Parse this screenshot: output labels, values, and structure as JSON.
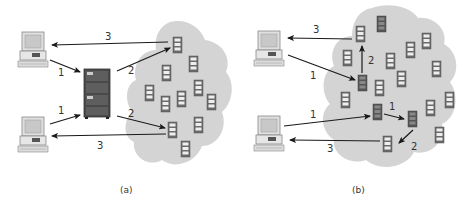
{
  "panels": [
    {
      "caption": "(a)",
      "arrow_labels": {
        "top_in": "1",
        "bottom_in": "1",
        "top_out": "2",
        "bottom_out": "2",
        "top_return": "3",
        "bottom_return": "3"
      }
    },
    {
      "caption": "(b)",
      "arrow_labels": {
        "top_in": "1",
        "top_hop": "2",
        "top_return": "3",
        "bottom_in": "1",
        "bottom_hop1": "1",
        "bottom_hop2": "2",
        "bottom_return": "3"
      }
    }
  ],
  "colors": {
    "cloud": "#d4d4d4",
    "arrow": "#1a1a1a",
    "server_dark": "#555555",
    "server_light": "#e8e8e8"
  }
}
